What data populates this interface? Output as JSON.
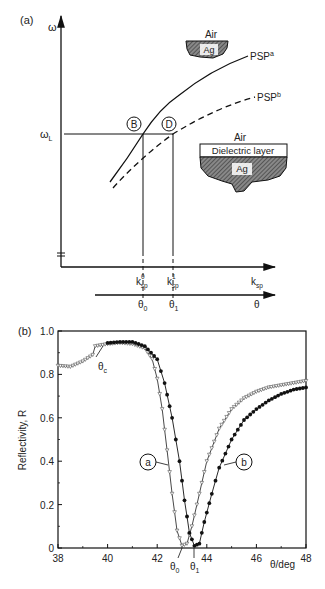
{
  "panel_a": {
    "label": "(a)",
    "y_axis_label": "ω",
    "omega_L_label": "ω",
    "omega_L_sub": "L",
    "point_B": "B",
    "point_D": "D",
    "curve_a_label": "PSP",
    "curve_a_sup": "a",
    "curve_b_label": "PSP",
    "curve_b_sup": "b",
    "inset_top": {
      "air": "Air",
      "metal": "Ag"
    },
    "inset_bottom": {
      "air": "Air",
      "layer": "Dielectric layer",
      "metal": "Ag"
    },
    "ksp0": {
      "base": "k",
      "sup": "0",
      "sub": "sp"
    },
    "ksp1": {
      "base": "k",
      "sup": "1",
      "sub": "sp"
    },
    "ksp_axis": {
      "base": "k",
      "sub": "sp"
    },
    "theta0": {
      "base": "θ",
      "sub": "0"
    },
    "theta1": {
      "base": "θ",
      "sub": "1"
    },
    "theta_axis": "θ"
  },
  "panel_b": {
    "label": "(b)",
    "ylabel": "Reflectivity, R",
    "xlabel": "θ/deg",
    "theta_c": {
      "base": "θ",
      "sub": "c"
    },
    "theta0": {
      "base": "θ",
      "sub": "0"
    },
    "theta1": {
      "base": "θ",
      "sub": "1"
    },
    "callout_a": "a",
    "callout_b": "b",
    "yticks": [
      "0",
      "0.2",
      "0.4",
      "0.6",
      "0.8",
      "1.0"
    ],
    "xticks": [
      "38",
      "40",
      "42",
      "44",
      "46",
      "48"
    ]
  },
  "chart_data": [
    {
      "type": "line",
      "title": "(a) Surface plasmon dispersion",
      "xlabel": "k_sp",
      "ylabel": "ω",
      "series": [
        {
          "name": "PSP^a (Air/Ag)",
          "style": "solid"
        },
        {
          "name": "PSP^b (Air/Dielectric layer/Ag)",
          "style": "dashed"
        }
      ],
      "annotations": [
        "B at (k_sp^0, ω_L)",
        "D at (k_sp^1, ω_L)",
        "second axis θ with θ0, θ1"
      ]
    },
    {
      "type": "scatter",
      "title": "(b)",
      "xlabel": "θ/deg",
      "ylabel": "Reflectivity, R",
      "xlim": [
        38,
        48
      ],
      "ylim": [
        0,
        1.0
      ],
      "legend": [
        "a",
        "b"
      ],
      "annotations": [
        "θc ≈ 39.5",
        "θ0 ≈ 43.0",
        "θ1 ≈ 43.5"
      ],
      "series": [
        {
          "name": "a",
          "marker": "open-triangle",
          "x": [
            38,
            38.5,
            39,
            39.4,
            39.5,
            40,
            40.5,
            41,
            41.5,
            41.8,
            42,
            42.2,
            42.4,
            42.6,
            42.8,
            43.0,
            43.2,
            43.4,
            43.6,
            43.8,
            44,
            44.5,
            45,
            45.5,
            46,
            46.5,
            47,
            47.5,
            48
          ],
          "y": [
            0.84,
            0.835,
            0.86,
            0.89,
            0.93,
            0.94,
            0.945,
            0.94,
            0.92,
            0.87,
            0.78,
            0.64,
            0.45,
            0.25,
            0.08,
            0.01,
            0.02,
            0.1,
            0.2,
            0.3,
            0.4,
            0.55,
            0.64,
            0.69,
            0.72,
            0.74,
            0.75,
            0.76,
            0.77
          ]
        },
        {
          "name": "b",
          "marker": "filled-circle",
          "x": [
            40,
            40.5,
            41,
            41.5,
            42,
            42.3,
            42.6,
            42.9,
            43.1,
            43.3,
            43.5,
            43.7,
            43.9,
            44.2,
            44.5,
            45,
            45.5,
            46,
            46.5,
            47,
            47.5,
            48
          ],
          "y": [
            0.945,
            0.95,
            0.95,
            0.93,
            0.87,
            0.76,
            0.6,
            0.4,
            0.22,
            0.07,
            0.01,
            0.02,
            0.12,
            0.25,
            0.37,
            0.5,
            0.59,
            0.64,
            0.68,
            0.71,
            0.73,
            0.74
          ]
        }
      ]
    }
  ]
}
